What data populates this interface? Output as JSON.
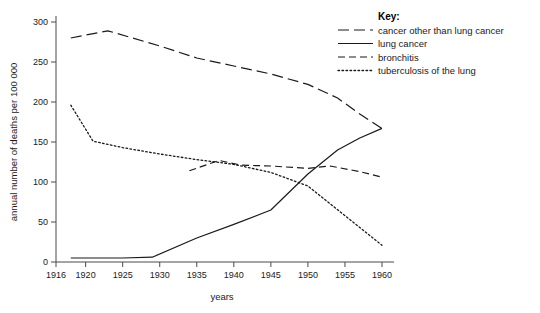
{
  "chart_data": {
    "type": "line",
    "title": "",
    "xlabel": "years",
    "ylabel": "annual number of deaths per 100 000",
    "xlim": [
      1916,
      1961
    ],
    "ylim": [
      0,
      310
    ],
    "xticks": [
      1916,
      1920,
      1925,
      1930,
      1935,
      1940,
      1945,
      1950,
      1955,
      1960
    ],
    "yticks": [
      0,
      50,
      100,
      150,
      200,
      250,
      300
    ],
    "grid": false,
    "legend_position": "top-right",
    "legend_title": "Key:",
    "series": [
      {
        "name": "cancer other than lung cancer",
        "dash": "long-dash",
        "x": [
          1918,
          1923,
          1930,
          1935,
          1940,
          1945,
          1950,
          1954,
          1957,
          1960
        ],
        "values": [
          280,
          289,
          270,
          255,
          245,
          235,
          222,
          205,
          185,
          167
        ]
      },
      {
        "name": "lung cancer",
        "dash": "solid",
        "x": [
          1918,
          1925,
          1929,
          1935,
          1940,
          1945,
          1950,
          1954,
          1957,
          1960
        ],
        "values": [
          5,
          5,
          6,
          30,
          47,
          65,
          110,
          140,
          155,
          167
        ]
      },
      {
        "name": "bronchitis",
        "dash": "medium-dash",
        "x": [
          1934,
          1938,
          1941,
          1945,
          1950,
          1953,
          1957,
          1960
        ],
        "values": [
          114,
          127,
          121,
          120,
          117,
          120,
          113,
          106
        ]
      },
      {
        "name": "tuberculosis of the lung",
        "dash": "dotted",
        "x": [
          1918,
          1921,
          1925,
          1930,
          1935,
          1940,
          1945,
          1950,
          1955,
          1960
        ],
        "values": [
          196,
          151,
          143,
          135,
          128,
          122,
          112,
          95,
          58,
          21
        ]
      }
    ]
  },
  "legend": {
    "title": "Key:",
    "entries": [
      {
        "label": "cancer other than lung cancer",
        "style": "long-dash"
      },
      {
        "label": "lung cancer",
        "style": "solid"
      },
      {
        "label": "bronchitis",
        "style": "medium-dash"
      },
      {
        "label": "tuberculosis of the lung",
        "style": "dotted"
      }
    ]
  },
  "axes": {
    "x_title": "years",
    "y_title": "annual number of deaths per 100 000",
    "x_tick_labels": [
      "1916",
      "1920",
      "1925",
      "1930",
      "1935",
      "1940",
      "1945",
      "1950",
      "1955",
      "1960"
    ],
    "y_tick_labels": [
      "0",
      "50",
      "100",
      "150",
      "200",
      "250",
      "300"
    ]
  },
  "colors": {
    "line": "#1a1a1a",
    "axis": "#4a4a4a",
    "background": "#ffffff",
    "text": "#1a1a1a"
  }
}
